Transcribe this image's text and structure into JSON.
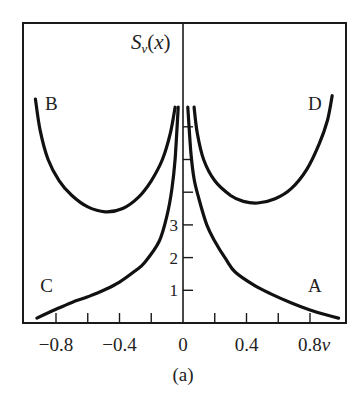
{
  "chart_data": {
    "type": "line",
    "caption": "(a)",
    "xlabel": "v",
    "ylabel": "S_v(x)",
    "xlim": [
      -1.0,
      1.03
    ],
    "ylim": [
      0,
      9.2
    ],
    "grid": false,
    "legend": "inline curve labels",
    "x_ticks": [
      -0.8,
      -0.6,
      -0.4,
      -0.2,
      0,
      0.2,
      0.4,
      0.6,
      0.8
    ],
    "x_tick_labels": [
      {
        "v": -0.8,
        "label": "−0.8"
      },
      {
        "v": -0.4,
        "label": "−0.4"
      },
      {
        "v": 0,
        "label": "0"
      },
      {
        "v": 0.4,
        "label": "0.4"
      },
      {
        "v": 0.8,
        "label": "0.8v"
      }
    ],
    "y_ticks": [
      1,
      2,
      3,
      4,
      5,
      6
    ],
    "y_tick_labels": [
      {
        "s": 1,
        "label": "1"
      },
      {
        "s": 2,
        "label": "2"
      },
      {
        "s": 3,
        "label": "3"
      }
    ],
    "series": [
      {
        "name": "A",
        "label_pos": {
          "v": 0.83,
          "s": 0.95
        },
        "points": [
          [
            0.03,
            6.6
          ],
          [
            0.05,
            5.2
          ],
          [
            0.07,
            4.4
          ],
          [
            0.1,
            3.8
          ],
          [
            0.15,
            3.0
          ],
          [
            0.2,
            2.5
          ],
          [
            0.27,
            1.95
          ],
          [
            0.33,
            1.55
          ],
          [
            0.45,
            1.15
          ],
          [
            0.55,
            0.9
          ],
          [
            0.68,
            0.62
          ],
          [
            0.8,
            0.4
          ],
          [
            0.9,
            0.25
          ],
          [
            0.98,
            0.15
          ]
        ]
      },
      {
        "name": "B",
        "label_pos": {
          "v": -0.83,
          "s": 6.5
        },
        "points": [
          [
            -0.93,
            6.85
          ],
          [
            -0.9,
            5.9
          ],
          [
            -0.85,
            5.0
          ],
          [
            -0.78,
            4.35
          ],
          [
            -0.7,
            3.9
          ],
          [
            -0.6,
            3.55
          ],
          [
            -0.49,
            3.4
          ],
          [
            -0.38,
            3.5
          ],
          [
            -0.28,
            3.85
          ],
          [
            -0.2,
            4.35
          ],
          [
            -0.13,
            5.0
          ],
          [
            -0.08,
            5.8
          ],
          [
            -0.05,
            6.6
          ]
        ]
      },
      {
        "name": "C",
        "label_pos": {
          "v": -0.86,
          "s": 0.95
        },
        "points": [
          [
            -0.92,
            0.15
          ],
          [
            -0.8,
            0.42
          ],
          [
            -0.7,
            0.63
          ],
          [
            -0.6,
            0.8
          ],
          [
            -0.5,
            1.0
          ],
          [
            -0.4,
            1.25
          ],
          [
            -0.3,
            1.6
          ],
          [
            -0.24,
            1.86
          ],
          [
            -0.15,
            2.5
          ],
          [
            -0.1,
            3.3
          ],
          [
            -0.07,
            4.1
          ],
          [
            -0.05,
            5.0
          ],
          [
            -0.03,
            6.6
          ]
        ]
      },
      {
        "name": "D",
        "label_pos": {
          "v": 0.83,
          "s": 6.5
        },
        "points": [
          [
            0.07,
            6.6
          ],
          [
            0.09,
            5.8
          ],
          [
            0.13,
            5.0
          ],
          [
            0.2,
            4.35
          ],
          [
            0.3,
            3.9
          ],
          [
            0.38,
            3.72
          ],
          [
            0.47,
            3.67
          ],
          [
            0.58,
            3.8
          ],
          [
            0.68,
            4.1
          ],
          [
            0.78,
            4.7
          ],
          [
            0.86,
            5.5
          ],
          [
            0.91,
            6.2
          ],
          [
            0.94,
            6.95
          ]
        ]
      }
    ]
  }
}
